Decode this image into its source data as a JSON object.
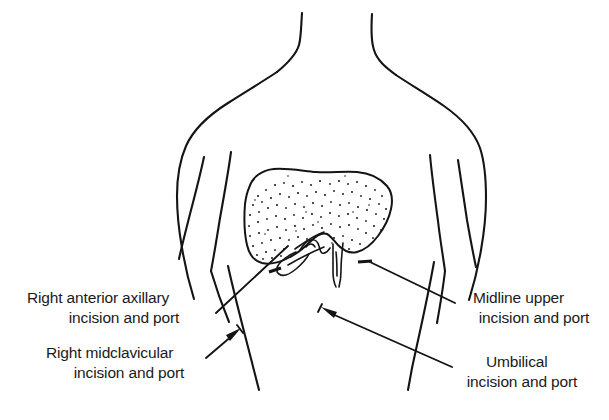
{
  "figure": {
    "background_color": "#ffffff",
    "ink_color": "#141414",
    "text_color": "#1a1a1a"
  },
  "labels": {
    "right_anterior_axillary": {
      "line1": "Right anterior axillary",
      "line2": "incision and port"
    },
    "right_midclavicular": {
      "line1": "Right midclavicular",
      "line2": "incision and port"
    },
    "midline_upper": {
      "line1": "Midline upper",
      "line2": "incision and port"
    },
    "umbilical": {
      "line1": "Umbilical",
      "line2": "incision and port"
    }
  },
  "anatomy": {
    "torso": "torso-outline",
    "neck": "neck-outline",
    "left_arm": "left-arm-outline",
    "right_arm": "right-arm-outline",
    "liver": "liver-outline",
    "gallbladder": "gallbladder-outline",
    "falciform": "falciform-ligament"
  },
  "port_sites": {
    "count": 4,
    "names": [
      "Right anterior axillary",
      "Right midclavicular",
      "Midline upper",
      "Umbilical"
    ]
  }
}
